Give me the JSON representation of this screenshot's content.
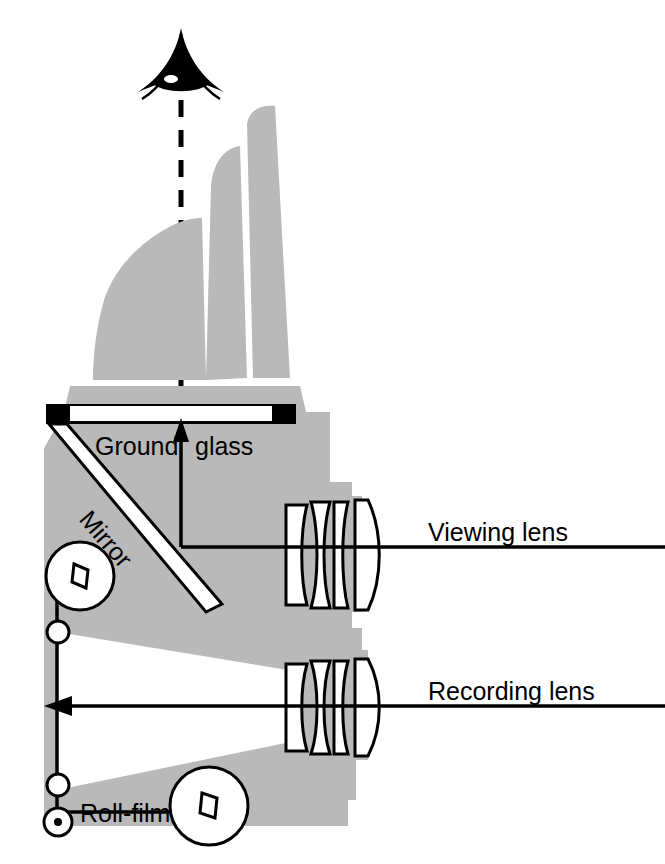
{
  "figure": {
    "background_color": "#ffffff",
    "body_gray": "#b9b9b9",
    "line_color": "#000000",
    "white": "#ffffff"
  },
  "labels": {
    "ground_glass_part1": "Ground",
    "ground_glass_part2": "glass",
    "mirror": "Mirror",
    "viewing_lens": "Viewing lens",
    "recording_lens": "Recording lens",
    "roll_film": "Roll-film"
  },
  "icons": {
    "eye": "eye-icon",
    "sight_line": "dashed-sight-line",
    "up_arrow": "up-arrow",
    "left_arrow": "left-arrow"
  },
  "parts": {
    "hood": "viewfinder-hood",
    "hood_front_flap": "hood-front-flap",
    "hood_collar": "hood-collar",
    "ground_glass": "ground-glass-screen",
    "mirror": "reflex-mirror",
    "viewing_lens_group": "viewing-lens-group",
    "recording_lens_group": "recording-lens-group",
    "supply_spool": "film-supply-spool",
    "takeup_spool": "film-takeup-spool",
    "roller_upper": "film-roller-upper",
    "roller_lower": "film-roller-lower",
    "sprocket": "film-sprocket",
    "film_plane": "film-plane",
    "light_cone": "light-cone"
  }
}
